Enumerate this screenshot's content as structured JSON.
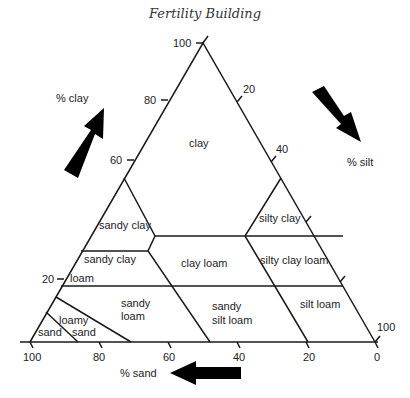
{
  "header": {
    "title": "Fertility Building"
  },
  "axes": {
    "clay": {
      "label": "% clay",
      "ticks": [
        "100",
        "80",
        "60",
        "20"
      ]
    },
    "silt": {
      "label": "% silt",
      "ticks": [
        "20",
        "40",
        "100"
      ]
    },
    "sand": {
      "label": "% sand",
      "ticks": [
        "100",
        "80",
        "60",
        "40",
        "20",
        "0"
      ]
    }
  },
  "regions": {
    "clay": "clay",
    "sandy_clay_top": "sandy clay",
    "silty_clay": "silty clay",
    "sandy_clay_lower": "sandy clay",
    "loam": "loam",
    "clay_loam": "clay loam",
    "silty_clay_loam": "silty clay loam",
    "sandy_loam_1": "sandy",
    "sandy_loam_2": "loam",
    "sandy_silt_loam_1": "sandy",
    "sandy_silt_loam_2": "silt loam",
    "silt_loam": "silt loam",
    "loamy_sand_1": "loamy",
    "loamy_sand_2": "sand",
    "sand": "sand"
  },
  "colors": {
    "line": "#1a1a1a",
    "arrow": "#000000"
  }
}
